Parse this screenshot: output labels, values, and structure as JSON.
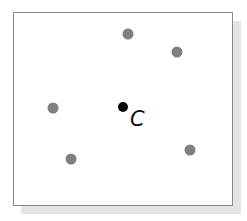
{
  "diagram": {
    "colors": {
      "frame": "#8a8a8a",
      "point": "#808080",
      "center_point": "#0a0a0a",
      "shadow": "#e4e4e4"
    },
    "center": {
      "label": "C",
      "x": 123,
      "y": 107
    },
    "points": [
      {
        "x": 128,
        "y": 34
      },
      {
        "x": 177,
        "y": 52
      },
      {
        "x": 53,
        "y": 108
      },
      {
        "x": 71,
        "y": 159
      },
      {
        "x": 190,
        "y": 150
      }
    ]
  }
}
